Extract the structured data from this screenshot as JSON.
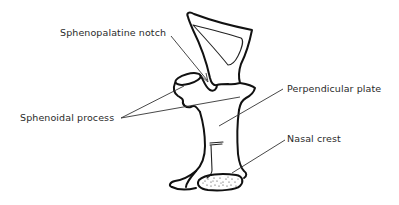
{
  "diagram": {
    "labels": {
      "sphenopalatine_notch": "Sphenopalatine notch",
      "sphenoidal_process": "Sphenoidal process",
      "perpendicular_plate": "Perpendicular plate",
      "nasal_crest": "Nasal crest"
    },
    "colors": {
      "line": "#111111",
      "text": "#2a2a2a",
      "background": "#ffffff"
    }
  }
}
